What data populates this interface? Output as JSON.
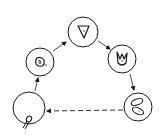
{
  "diagram": {
    "type": "cycle",
    "stroke_color": "#1a1a1a",
    "background": "#ffffff",
    "nodes": [
      {
        "id": "top",
        "cx": 83,
        "cy": 32,
        "r": 15,
        "glyph": "triangle-cell-icon"
      },
      {
        "id": "right",
        "cx": 122,
        "cy": 59,
        "r": 14,
        "glyph": "forked-cell-icon"
      },
      {
        "id": "bottom-right",
        "cx": 138,
        "cy": 107,
        "r": 14,
        "glyph": "split-cell-icon"
      },
      {
        "id": "bottom-left",
        "cx": 29,
        "cy": 108,
        "r": 16,
        "glyph": "tailed-cell-icon"
      },
      {
        "id": "left",
        "cx": 40,
        "cy": 62,
        "r": 14,
        "glyph": "rounded-cell-icon"
      }
    ],
    "edges": [
      {
        "from": "left",
        "to": "top",
        "style": "solid"
      },
      {
        "from": "top",
        "to": "right",
        "style": "solid"
      },
      {
        "from": "right",
        "to": "bottom-right",
        "style": "solid"
      },
      {
        "from": "bottom-right",
        "to": "bottom-left",
        "style": "dashed"
      },
      {
        "from": "bottom-left",
        "to": "left",
        "style": "solid"
      }
    ]
  }
}
